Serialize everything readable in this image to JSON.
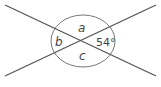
{
  "diagram": {
    "colors": {
      "line": "#555555",
      "circle": "#777777",
      "text": "#444444",
      "background": "#ffffff"
    },
    "lines": [
      {
        "id": "line-1",
        "x1": 5,
        "y1": 5,
        "x2": 156,
        "y2": 76
      },
      {
        "id": "line-2",
        "x1": 5,
        "y1": 76,
        "x2": 156,
        "y2": 5
      }
    ],
    "intersection": {
      "x": 81,
      "y": 41
    },
    "circle": {
      "cx": 83,
      "cy": 41,
      "rx": 32,
      "ry": 26
    },
    "labels": {
      "a": "a",
      "b": "b",
      "c": "c",
      "given": "54°"
    }
  }
}
